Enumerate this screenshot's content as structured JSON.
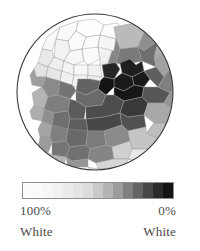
{
  "figure": {
    "kind": "choropleth-map",
    "shape": "circular-clip",
    "background_color": "#ffffff"
  },
  "map": {
    "name": "percent-white-choropleth",
    "outline_color": "#3a3a3a",
    "border_color": "#9a9a9a",
    "circle": {
      "cx": 79,
      "cy": 85,
      "r": 78
    }
  },
  "legend": {
    "title": "",
    "orientation": "horizontal",
    "swatch_colors": [
      "#fcfcfc",
      "#fafafa",
      "#f6f6f6",
      "#f1f1f1",
      "#ebebeb",
      "#e4e4e4",
      "#dcdcdc",
      "#c9c9c9",
      "#b4b4b4",
      "#9c9c9c",
      "#7f7f7f",
      "#636363",
      "#474747",
      "#2b2b2b",
      "#141414"
    ],
    "left_value": "100%",
    "right_value": "0%",
    "left_group": "White",
    "right_group": "White",
    "text_color": "#4a4a4a"
  },
  "chart_data": {
    "type": "heatmap",
    "title": "",
    "subtitle": "",
    "xlabel": "",
    "ylabel": "",
    "variable": "Percent White",
    "unit": "%",
    "value_range": [
      0,
      100
    ],
    "colormap": "grays-reversed",
    "colormap_low_value_color": "#141414",
    "colormap_high_value_color": "#fcfcfc",
    "legend_position": "below",
    "grid": false,
    "bins": [
      {
        "label": "100%",
        "value": 100,
        "color": "#fcfcfc"
      },
      {
        "label": "93%",
        "value": 93,
        "color": "#f6f6f6"
      },
      {
        "label": "86%",
        "value": 86,
        "color": "#ebebeb"
      },
      {
        "label": "79%",
        "value": 79,
        "color": "#dcdcdc"
      },
      {
        "label": "71%",
        "value": 71,
        "color": "#c9c9c9"
      },
      {
        "label": "64%",
        "value": 64,
        "color": "#b4b4b4"
      },
      {
        "label": "57%",
        "value": 57,
        "color": "#9c9c9c"
      },
      {
        "label": "50%",
        "value": 50,
        "color": "#7f7f7f"
      },
      {
        "label": "36%",
        "value": 36,
        "color": "#636363"
      },
      {
        "label": "21%",
        "value": 21,
        "color": "#474747"
      },
      {
        "label": "7%",
        "value": 7,
        "color": "#2b2b2b"
      },
      {
        "label": "0%",
        "value": 0,
        "color": "#141414"
      }
    ],
    "regions": [
      {
        "id": "r01",
        "value": 99,
        "color": "#fdfdfd",
        "points": "62,14 78,12 88,18 84,28 70,30 60,24"
      },
      {
        "id": "r02",
        "value": 98,
        "color": "#fbfbfb",
        "points": "88,18 101,16 108,24 100,32 84,28"
      },
      {
        "id": "r03",
        "value": 97,
        "color": "#fafafa",
        "points": "44,20 62,14 60,24 52,34 40,32"
      },
      {
        "id": "r04",
        "value": 96,
        "color": "#f8f8f8",
        "points": "31,30 44,20 40,32 36,44 26,42"
      },
      {
        "id": "r05",
        "value": 98,
        "color": "#fcfcfc",
        "points": "52,34 60,24 70,30 66,42 54,44"
      },
      {
        "id": "r06",
        "value": 97,
        "color": "#fafafa",
        "points": "70,30 84,28 82,40 70,44 66,42"
      },
      {
        "id": "r07",
        "value": 95,
        "color": "#f5f5f5",
        "points": "84,28 100,32 98,44 86,46 82,40"
      },
      {
        "id": "r08",
        "value": 94,
        "color": "#f2f2f2",
        "points": "40,32 52,34 54,44 48,54 38,50"
      },
      {
        "id": "r09",
        "value": 96,
        "color": "#f7f7f7",
        "points": "54,44 66,42 68,54 58,58 48,54"
      },
      {
        "id": "r10",
        "value": 97,
        "color": "#fafafa",
        "points": "66,42 82,40 84,52 72,58 68,54"
      },
      {
        "id": "r11",
        "value": 93,
        "color": "#f0f0f0",
        "points": "82,40 98,44 96,56 84,58 84,52"
      },
      {
        "id": "r12",
        "value": 90,
        "color": "#e9e9e9",
        "points": "26,42 36,44 38,50 32,60 22,56"
      },
      {
        "id": "r13",
        "value": 92,
        "color": "#eeeeee",
        "points": "38,50 48,54 46,64 36,66 32,60"
      },
      {
        "id": "r14",
        "value": 95,
        "color": "#f4f4f4",
        "points": "48,54 58,58 58,68 48,70 46,64"
      },
      {
        "id": "r15",
        "value": 96,
        "color": "#f7f7f7",
        "points": "58,58 72,58 72,68 62,72 58,68"
      },
      {
        "id": "r16",
        "value": 94,
        "color": "#f1f1f1",
        "points": "72,58 84,58 86,70 74,72 72,68"
      },
      {
        "id": "r17",
        "value": 88,
        "color": "#e3e3e3",
        "points": "22,56 32,60 30,70 20,70 18,62"
      },
      {
        "id": "r18",
        "value": 89,
        "color": "#e6e6e6",
        "points": "32,60 46,64 44,74 32,76 30,70"
      },
      {
        "id": "r19",
        "value": 93,
        "color": "#f0f0f0",
        "points": "46,64 58,68 56,78 46,80 44,74"
      },
      {
        "id": "r20",
        "value": 94,
        "color": "#f2f2f2",
        "points": "58,68 72,68 70,78 58,80 56,78"
      },
      {
        "id": "r21",
        "value": 91,
        "color": "#ececec",
        "points": "72,68 86,70 84,80 72,80 70,78"
      },
      {
        "id": "r22",
        "value": 66,
        "color": "#bababa",
        "points": "98,20 118,16 128,26 122,40 104,42 100,32"
      },
      {
        "id": "r23",
        "value": 52,
        "color": "#8f8f8f",
        "points": "118,16 136,20 142,34 128,44 122,40 128,26"
      },
      {
        "id": "r24",
        "value": 61,
        "color": "#ababab",
        "points": "136,20 150,32 150,48 138,50 142,34"
      },
      {
        "id": "r25",
        "value": 48,
        "color": "#868686",
        "points": "100,32 104,42 100,56 92,56 96,44 98,44"
      },
      {
        "id": "r26",
        "value": 44,
        "color": "#7a7a7a",
        "points": "104,42 122,40 126,54 108,58 100,56"
      },
      {
        "id": "r27",
        "value": 40,
        "color": "#6e6e6e",
        "points": "122,40 128,44 142,34 138,50 140,60 126,54"
      },
      {
        "id": "r28",
        "value": 58,
        "color": "#a2a2a2",
        "points": "138,50 150,48 156,60 148,70 140,60"
      },
      {
        "id": "r29",
        "value": 8,
        "color": "#1f1f1f",
        "points": "104,56 114,52 120,58 126,54 128,64 116,70 106,66"
      },
      {
        "id": "r30",
        "value": 5,
        "color": "#191919",
        "points": "116,70 128,64 134,72 128,80 118,78"
      },
      {
        "id": "r31",
        "value": 34,
        "color": "#5f5f5f",
        "points": "128,64 140,60 148,70 142,80 134,72"
      },
      {
        "id": "r32",
        "value": 46,
        "color": "#808080",
        "points": "148,70 156,60 162,74 154,86 142,80"
      },
      {
        "id": "r33",
        "value": 70,
        "color": "#c2c2c2",
        "points": "150,32 158,44 162,62 156,60 150,48"
      },
      {
        "id": "r34",
        "value": 12,
        "color": "#262626",
        "points": "86,58 96,56 100,56 104,62 98,72 88,70"
      },
      {
        "id": "r35",
        "value": 6,
        "color": "#1b1b1b",
        "points": "98,72 106,66 116,70 118,78 108,84 98,80"
      },
      {
        "id": "r36",
        "value": 3,
        "color": "#141414",
        "points": "88,70 98,72 98,80 90,88 82,82 84,74"
      },
      {
        "id": "r37",
        "value": 4,
        "color": "#171717",
        "points": "98,80 108,84 118,78 128,80 126,90 108,94 98,88"
      },
      {
        "id": "r38",
        "value": 30,
        "color": "#565656",
        "points": "128,80 142,80 154,86 148,96 132,96 126,90"
      },
      {
        "id": "r39",
        "value": 54,
        "color": "#959595",
        "points": "154,86 162,74 166,92 158,104 148,96"
      },
      {
        "id": "r40",
        "value": 36,
        "color": "#636363",
        "points": "62,72 74,72 84,74 82,82 70,88 60,84"
      },
      {
        "id": "r41",
        "value": 42,
        "color": "#747474",
        "points": "44,74 56,78 58,80 60,84 54,92 42,88"
      },
      {
        "id": "r42",
        "value": 38,
        "color": "#6a6a6a",
        "points": "60,84 70,88 82,82 90,88 86,98 70,100 60,94"
      },
      {
        "id": "r43",
        "value": 50,
        "color": "#8a8a8a",
        "points": "30,70 44,74 42,88 32,90 26,80"
      },
      {
        "id": "r44",
        "value": 56,
        "color": "#9e9e9e",
        "points": "18,62 20,70 30,70 26,80 16,78 14,68"
      },
      {
        "id": "r45",
        "value": 64,
        "color": "#b4b4b4",
        "points": "26,80 32,90 28,102 18,98 16,86"
      },
      {
        "id": "r46",
        "value": 46,
        "color": "#7f7f7f",
        "points": "32,90 42,88 54,92 52,104 38,106 28,102"
      },
      {
        "id": "r47",
        "value": 32,
        "color": "#5b5b5b",
        "points": "54,92 60,94 70,100 68,112 54,112 52,104"
      },
      {
        "id": "r48",
        "value": 26,
        "color": "#4c4c4c",
        "points": "70,100 86,98 90,88 98,88 108,94 104,106 88,110 70,112"
      },
      {
        "id": "r49",
        "value": 18,
        "color": "#393939",
        "points": "108,94 126,90 132,96 128,108 112,110 104,106"
      },
      {
        "id": "r50",
        "value": 60,
        "color": "#a8a8a8",
        "points": "132,96 148,96 158,104 152,116 138,116 128,108"
      },
      {
        "id": "r51",
        "value": 74,
        "color": "#cbcbcb",
        "points": "158,104 166,92 168,106 162,118 152,116"
      },
      {
        "id": "r52",
        "value": 62,
        "color": "#aeaeae",
        "points": "18,98 28,102 26,114 16,112 14,104"
      },
      {
        "id": "r53",
        "value": 52,
        "color": "#909090",
        "points": "28,102 38,106 36,118 26,120 26,114"
      },
      {
        "id": "r54",
        "value": 40,
        "color": "#6f6f6f",
        "points": "38,106 52,104 54,112 52,122 38,124 36,118"
      },
      {
        "id": "r55",
        "value": 34,
        "color": "#5e5e5e",
        "points": "54,112 68,112 70,112 72,124 56,126 52,122"
      },
      {
        "id": "r56",
        "value": 24,
        "color": "#474747",
        "points": "70,112 88,110 104,106 106,118 88,124 72,124"
      },
      {
        "id": "r57",
        "value": 28,
        "color": "#515151",
        "points": "104,106 112,110 128,108 130,120 112,124 106,118"
      },
      {
        "id": "r58",
        "value": 68,
        "color": "#bebebe",
        "points": "138,116 152,116 156,128 142,132 130,126"
      },
      {
        "id": "r59",
        "value": 80,
        "color": "#dadada",
        "points": "152,116 162,118 164,130 156,134 156,128"
      },
      {
        "id": "r60",
        "value": 58,
        "color": "#a4a4a4",
        "points": "26,114 36,118 34,130 24,130 22,122"
      },
      {
        "id": "r61",
        "value": 46,
        "color": "#808080",
        "points": "36,118 52,122 50,134 36,136 34,130"
      },
      {
        "id": "r62",
        "value": 38,
        "color": "#696969",
        "points": "52,122 72,124 70,138 54,140 50,134"
      },
      {
        "id": "r63",
        "value": 44,
        "color": "#7b7b7b",
        "points": "72,124 88,124 90,138 74,142 70,138"
      },
      {
        "id": "r64",
        "value": 50,
        "color": "#8b8b8b",
        "points": "88,124 106,118 112,124 114,134 96,140 90,138"
      },
      {
        "id": "r65",
        "value": 72,
        "color": "#c5c5c5",
        "points": "112,124 130,120 130,126 142,132 136,142 116,142 114,134"
      },
      {
        "id": "r66",
        "value": 84,
        "color": "#e2e2e2",
        "points": "142,132 156,128 156,134 150,146 138,146 136,142"
      },
      {
        "id": "r67",
        "value": 56,
        "color": "#9b9b9b",
        "points": "24,130 34,130 36,136 32,146 22,142"
      },
      {
        "id": "r68",
        "value": 42,
        "color": "#757575",
        "points": "36,136 50,134 54,140 50,150 36,148"
      },
      {
        "id": "r69",
        "value": 40,
        "color": "#707070",
        "points": "54,140 70,138 74,142 72,152 56,154 50,150"
      },
      {
        "id": "r70",
        "value": 48,
        "color": "#858585",
        "points": "74,142 90,138 96,140 98,152 80,156 72,152"
      },
      {
        "id": "r71",
        "value": 76,
        "color": "#d0d0d0",
        "points": "96,140 114,134 116,142 112,152 98,152"
      },
      {
        "id": "r72",
        "value": 86,
        "color": "#e7e7e7",
        "points": "116,142 136,142 138,146 132,154 112,152"
      },
      {
        "id": "r73",
        "value": 64,
        "color": "#b2b2b2",
        "points": "32,146 36,148 50,150 48,158 34,156"
      },
      {
        "id": "r74",
        "value": 54,
        "color": "#969696",
        "points": "50,150 56,154 72,152 72,160 52,160"
      },
      {
        "id": "r75",
        "value": 78,
        "color": "#d6d6d6",
        "points": "80,156 98,152 112,152 110,160 82,162"
      },
      {
        "id": "r76",
        "value": 88,
        "color": "#ececec",
        "points": "112,152 132,154 138,146 150,146 146,156 126,160"
      },
      {
        "id": "r77",
        "value": 82,
        "color": "#dedede",
        "points": "72,160 82,162 110,160 104,166 76,166"
      },
      {
        "id": "r78",
        "value": 70,
        "color": "#c0c0c0",
        "points": "34,156 48,158 52,160 48,164 36,162"
      },
      {
        "id": "r79",
        "value": 90,
        "color": "#eaeaea",
        "points": "146,156 158,148 162,132 164,130 160,142 156,156"
      },
      {
        "id": "r80",
        "value": 92,
        "color": "#efefef",
        "points": "110,160 126,160 146,156 136,164 112,166"
      }
    ]
  }
}
